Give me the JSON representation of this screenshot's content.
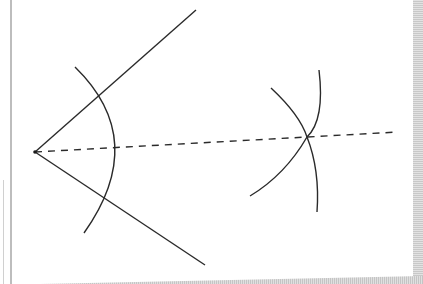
{
  "diagram": {
    "type": "geometric-construction",
    "colors": {
      "stroke": "#2a2a2a",
      "paper": "#ffffff",
      "edge": "#c4c4c4"
    },
    "vertex": {
      "x": 35,
      "y": 152
    },
    "rays": [
      {
        "name": "upper-ray",
        "x1": 35,
        "y1": 152,
        "x2": 196,
        "y2": 10
      },
      {
        "name": "lower-ray",
        "x1": 35,
        "y1": 152,
        "x2": 205,
        "y2": 265
      }
    ],
    "bisector": {
      "style": "dashed",
      "x1": 35,
      "y1": 152,
      "x2": 398,
      "y2": 132
    },
    "arcs": [
      {
        "name": "vertex-arc",
        "path": "M75,67 Q150,140 84,233"
      },
      {
        "name": "left-intersecting-arc",
        "path": "M271,88 Q300,115 307,137 Q285,175 250,196"
      },
      {
        "name": "right-intersecting-arc",
        "path": "M319,70 Q325,120 307,137 Q320,170 317,212"
      }
    ]
  }
}
